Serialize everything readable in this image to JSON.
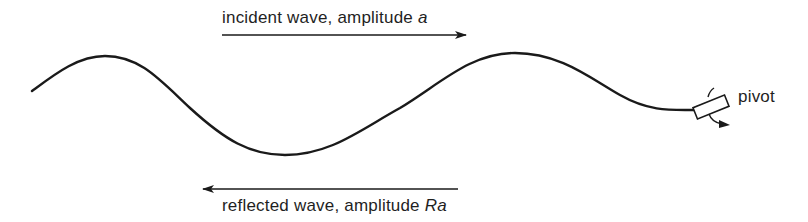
{
  "diagram": {
    "type": "wave-reflection",
    "incident": {
      "text": "incident wave, amplitude ",
      "symbol": "a",
      "direction": "right"
    },
    "reflected": {
      "text": "reflected wave, amplitude ",
      "symbol": "Ra",
      "direction": "left"
    },
    "pivot": {
      "label": "pivot"
    },
    "colors": {
      "stroke": "#1a1a1a",
      "background": "#ffffff"
    }
  }
}
